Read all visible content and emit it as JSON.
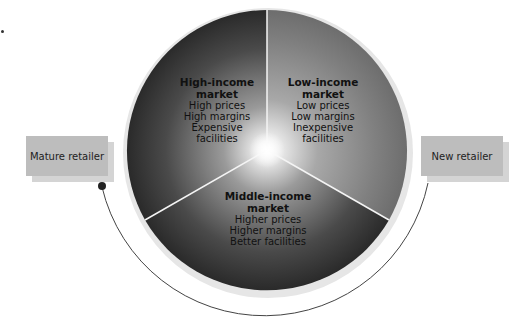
{
  "segments": [
    {
      "id": "high-income",
      "title_1": "High-income",
      "title_2": "market",
      "lines": [
        "High prices",
        "High margins",
        "Expensive",
        "facilities"
      ]
    },
    {
      "id": "low-income",
      "title_1": "Low-income",
      "title_2": "market",
      "lines": [
        "Low prices",
        "Low margins",
        "Inexpensive",
        "facilities"
      ]
    },
    {
      "id": "middle-income",
      "title_1": "Middle-income",
      "title_2": "market",
      "lines": [
        "Higher prices",
        "Higher margins",
        "Better facilities"
      ]
    }
  ],
  "retailers": {
    "mature": {
      "label": "Mature retailer"
    },
    "new": {
      "label": "New retailer"
    }
  },
  "colors": {
    "disc_dark": "#2a2a2a",
    "disc_light": "#ffffff",
    "box_fill": "#bdbdbd",
    "box_shadow": "#d4d4d4",
    "arc": "#444444"
  }
}
